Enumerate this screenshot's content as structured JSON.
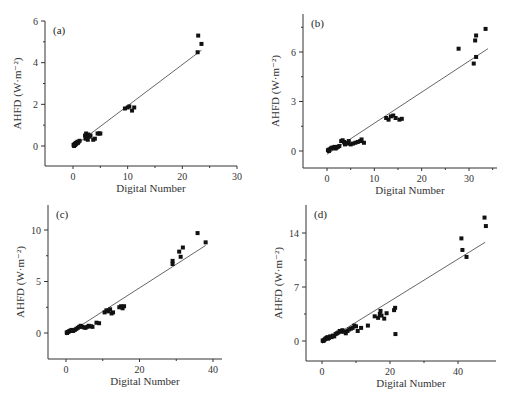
{
  "figure": {
    "width": 511,
    "height": 402,
    "axis_color": "#333333",
    "point_color": "#111111",
    "line_color": "#555555"
  },
  "chart_data": [
    {
      "type": "scatter",
      "panel_label": "(a)",
      "xlabel": "Digital Number",
      "ylabel": "AHFD (W·m⁻²)",
      "xlim": [
        -5,
        30
      ],
      "ylim": [
        -1,
        6
      ],
      "xticks": [
        0,
        10,
        20,
        30
      ],
      "yticks": [
        0,
        2,
        4,
        6
      ],
      "minor_xticks": [
        5,
        15,
        25
      ],
      "minor_yticks": [
        1,
        3,
        5
      ],
      "plot_box": {
        "x0": 45,
        "x1": 237,
        "y_top": 21,
        "y_bottom": 166,
        "x_zero_px": 73,
        "x_max_px": 237,
        "y_zero_px": 146,
        "y_max_px": 21
      },
      "fit_line": {
        "x": [
          0,
          23.5
        ],
        "y": [
          -0.05,
          4.6
        ]
      },
      "points": [
        [
          0.1,
          0.05
        ],
        [
          0.3,
          0.1
        ],
        [
          0.5,
          0.15
        ],
        [
          0.6,
          0.1
        ],
        [
          0.8,
          0.2
        ],
        [
          1.0,
          0.2
        ],
        [
          1.2,
          0.25
        ],
        [
          0.4,
          0.05
        ],
        [
          0.2,
          0.0
        ],
        [
          0.9,
          0.15
        ],
        [
          2.2,
          0.5
        ],
        [
          2.4,
          0.6
        ],
        [
          2.5,
          0.4
        ],
        [
          2.7,
          0.3
        ],
        [
          2.8,
          0.55
        ],
        [
          3.0,
          0.45
        ],
        [
          2.3,
          0.35
        ],
        [
          3.7,
          0.3
        ],
        [
          4.0,
          0.35
        ],
        [
          4.5,
          0.6
        ],
        [
          4.8,
          0.6
        ],
        [
          5.0,
          0.6
        ],
        [
          3.2,
          0.5
        ],
        [
          9.5,
          1.8
        ],
        [
          10.0,
          1.85
        ],
        [
          10.3,
          1.9
        ],
        [
          10.8,
          1.7
        ],
        [
          11.2,
          1.85
        ],
        [
          22.8,
          4.5
        ],
        [
          22.9,
          5.3
        ],
        [
          23.5,
          4.9
        ]
      ]
    },
    {
      "type": "scatter",
      "panel_label": "(b)",
      "xlabel": "Digital Number",
      "ylabel": "AHFD (W·m⁻²)",
      "xlim": [
        -5,
        36
      ],
      "ylim": [
        -1,
        8
      ],
      "xticks": [
        0,
        10,
        20,
        30
      ],
      "yticks": [
        0,
        3,
        6
      ],
      "minor_xticks": [
        5,
        15,
        25,
        35
      ],
      "minor_yticks": [
        1.5,
        4.5,
        7.5
      ],
      "plot_box": {
        "x0": 303,
        "x1": 497,
        "y_top": 14,
        "y_bottom": 168,
        "x_zero_px": 327,
        "x_max_px": 469,
        "y_zero_px": 151,
        "y_max_px": 52
      },
      "fit_line": {
        "x": [
          0,
          34
        ],
        "y": [
          -0.2,
          6.2
        ]
      },
      "points": [
        [
          0.2,
          0.05
        ],
        [
          0.5,
          0.1
        ],
        [
          0.8,
          0.15
        ],
        [
          1.0,
          0.2
        ],
        [
          1.3,
          0.2
        ],
        [
          1.6,
          0.25
        ],
        [
          2.0,
          0.2
        ],
        [
          2.3,
          0.25
        ],
        [
          2.6,
          0.3
        ],
        [
          0.4,
          0.0
        ],
        [
          1.8,
          0.15
        ],
        [
          3.0,
          0.6
        ],
        [
          3.3,
          0.65
        ],
        [
          3.6,
          0.55
        ],
        [
          4.0,
          0.5
        ],
        [
          4.3,
          0.45
        ],
        [
          4.6,
          0.6
        ],
        [
          5.0,
          0.4
        ],
        [
          5.5,
          0.45
        ],
        [
          6.0,
          0.5
        ],
        [
          6.5,
          0.55
        ],
        [
          7.0,
          0.6
        ],
        [
          7.3,
          0.7
        ],
        [
          7.8,
          0.5
        ],
        [
          3.8,
          0.4
        ],
        [
          12.5,
          2.0
        ],
        [
          13.0,
          1.9
        ],
        [
          13.5,
          2.1
        ],
        [
          14.0,
          2.15
        ],
        [
          14.5,
          2.0
        ],
        [
          15.3,
          1.9
        ],
        [
          15.8,
          1.95
        ],
        [
          27.8,
          6.2
        ],
        [
          31.0,
          5.3
        ],
        [
          31.3,
          6.7
        ],
        [
          31.5,
          7.0
        ],
        [
          31.5,
          5.7
        ],
        [
          33.5,
          7.4
        ]
      ]
    },
    {
      "type": "scatter",
      "panel_label": "(c)",
      "xlabel": "Digital Number",
      "ylabel": "AHFD (W·m⁻²)",
      "xlim": [
        -5,
        42
      ],
      "ylim": [
        -2.5,
        12.5
      ],
      "xticks": [
        0,
        20,
        40
      ],
      "yticks": [
        0,
        5,
        10
      ],
      "minor_xticks": [
        10,
        30
      ],
      "minor_yticks": [
        2.5,
        7.5
      ],
      "plot_box": {
        "x0": 48,
        "x1": 222,
        "y_top": 205,
        "y_bottom": 359,
        "x_zero_px": 66,
        "x_max_px": 213,
        "y_zero_px": 333,
        "y_max_px": 230
      },
      "fit_line": {
        "x": [
          0,
          38
        ],
        "y": [
          -0.2,
          8.5
        ]
      },
      "points": [
        [
          0.2,
          0.05
        ],
        [
          0.5,
          0.1
        ],
        [
          0.8,
          0.15
        ],
        [
          1.0,
          0.2
        ],
        [
          1.3,
          0.25
        ],
        [
          1.6,
          0.3
        ],
        [
          2.0,
          0.25
        ],
        [
          2.4,
          0.3
        ],
        [
          2.8,
          0.4
        ],
        [
          3.2,
          0.5
        ],
        [
          3.6,
          0.6
        ],
        [
          4.0,
          0.7
        ],
        [
          4.4,
          0.6
        ],
        [
          4.8,
          0.55
        ],
        [
          0.3,
          0.0
        ],
        [
          1.9,
          0.2
        ],
        [
          5.3,
          0.5
        ],
        [
          5.8,
          0.6
        ],
        [
          6.2,
          0.7
        ],
        [
          6.8,
          0.65
        ],
        [
          7.2,
          0.6
        ],
        [
          8.3,
          1.0
        ],
        [
          9.0,
          0.95
        ],
        [
          10.5,
          2.0
        ],
        [
          11.0,
          2.2
        ],
        [
          11.5,
          2.1
        ],
        [
          12.0,
          2.3
        ],
        [
          12.4,
          1.9
        ],
        [
          12.8,
          2.0
        ],
        [
          14.5,
          2.5
        ],
        [
          15.0,
          2.6
        ],
        [
          15.4,
          2.4
        ],
        [
          15.8,
          2.6
        ],
        [
          29.0,
          6.7
        ],
        [
          29.0,
          7.0
        ],
        [
          30.8,
          7.9
        ],
        [
          31.2,
          7.4
        ],
        [
          31.8,
          8.3
        ],
        [
          35.8,
          9.7
        ],
        [
          38.0,
          8.8
        ]
      ]
    },
    {
      "type": "scatter",
      "panel_label": "(d)",
      "xlabel": "Digital Number",
      "ylabel": "AHFD (W·m⁻²)",
      "xlim": [
        -5,
        51
      ],
      "ylim": [
        -2.5,
        17
      ],
      "xticks": [
        0,
        20,
        40
      ],
      "yticks": [
        0,
        7,
        14
      ],
      "minor_xticks": [
        10,
        30
      ],
      "minor_yticks": [
        3.5,
        10.5
      ],
      "plot_box": {
        "x0": 306,
        "x1": 496,
        "y_top": 205,
        "y_bottom": 361,
        "x_zero_px": 322,
        "x_max_px": 458,
        "y_zero_px": 341,
        "y_max_px": 233
      },
      "fit_line": {
        "x": [
          0,
          48
        ],
        "y": [
          -0.3,
          12.8
        ]
      },
      "points": [
        [
          0.2,
          0.05
        ],
        [
          0.5,
          0.1
        ],
        [
          0.8,
          0.2
        ],
        [
          1.0,
          0.3
        ],
        [
          1.3,
          0.4
        ],
        [
          1.6,
          0.5
        ],
        [
          2.0,
          0.4
        ],
        [
          2.4,
          0.6
        ],
        [
          2.8,
          0.5
        ],
        [
          3.2,
          0.7
        ],
        [
          3.6,
          0.6
        ],
        [
          4.0,
          0.9
        ],
        [
          4.4,
          1.0
        ],
        [
          4.8,
          1.1
        ],
        [
          5.2,
          1.3
        ],
        [
          5.6,
          1.2
        ],
        [
          6.0,
          1.4
        ],
        [
          6.5,
          1.2
        ],
        [
          0.4,
          0.0
        ],
        [
          1.8,
          0.3
        ],
        [
          7.0,
          1.0
        ],
        [
          7.5,
          1.3
        ],
        [
          8.0,
          1.5
        ],
        [
          8.5,
          1.6
        ],
        [
          9.0,
          1.7
        ],
        [
          9.5,
          2.0
        ],
        [
          10.0,
          1.9
        ],
        [
          10.5,
          1.3
        ],
        [
          11.5,
          1.7
        ],
        [
          13.5,
          2.0
        ],
        [
          15.5,
          3.2
        ],
        [
          16.5,
          3.0
        ],
        [
          17.0,
          3.5
        ],
        [
          17.2,
          3.9
        ],
        [
          17.5,
          3.3
        ],
        [
          18.3,
          2.9
        ],
        [
          19.0,
          3.6
        ],
        [
          21.2,
          4.0
        ],
        [
          21.5,
          4.3
        ],
        [
          21.6,
          0.9
        ],
        [
          41.0,
          13.3
        ],
        [
          41.3,
          11.8
        ],
        [
          42.5,
          10.9
        ],
        [
          47.8,
          16.0
        ],
        [
          48.2,
          14.9
        ]
      ]
    }
  ]
}
